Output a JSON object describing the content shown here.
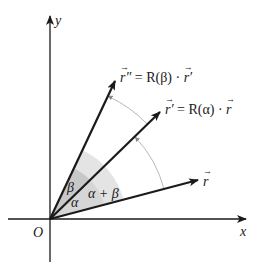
{
  "diagram": {
    "origin_label": "O",
    "axes": {
      "x_label": "x",
      "y_label": "y"
    },
    "vectors": [
      {
        "name": "r",
        "label": "r⃗",
        "label_text": "r"
      },
      {
        "name": "r_prime",
        "label": "r⃗′ = R(α) · r⃗",
        "label_lhs": "r′",
        "label_rhs": "= R(α) · ",
        "label_rhs_vec": "r"
      },
      {
        "name": "r_double_prime",
        "label": "r⃗″ = R(β) · r⃗′",
        "label_lhs": "r″",
        "label_rhs": "= R(β) · ",
        "label_rhs_vec": "r′"
      }
    ],
    "angles": {
      "alpha": "α",
      "beta": "β",
      "sum": "α + β"
    },
    "colors": {
      "line": "#1a1a1a",
      "arc": "#b0b0b0",
      "shade_light": "#e4e4e4",
      "shade_mid": "#d2d2d2",
      "shade_dark": "#c2c2c2"
    }
  }
}
